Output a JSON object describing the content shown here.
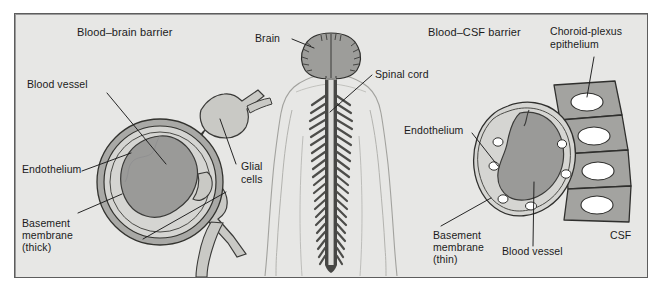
{
  "figure": {
    "panels": {
      "left_title": "Blood–brain barrier",
      "right_title": "Blood–CSF barrier"
    },
    "labels": {
      "blood_vessel_left": "Blood vessel",
      "endothelium_left": "Endothelium",
      "basement_membrane_left_l1": "Basement",
      "basement_membrane_left_l2": "membrane",
      "basement_membrane_left_l3": "(thick)",
      "glial_cells_l1": "Glial",
      "glial_cells_l2": "cells",
      "brain": "Brain",
      "spinal_cord": "Spinal cord",
      "choroid_plexus_l1": "Choroid-plexus",
      "choroid_plexus_l2": "epithelium",
      "endothelium_right": "Endothelium",
      "basement_membrane_right_l1": "Basement",
      "basement_membrane_right_l2": "membrane",
      "basement_membrane_right_l3": "(thin)",
      "blood_vessel_right": "Blood vessel",
      "csf": "CSF"
    },
    "colors": {
      "page_background": "#ffffff",
      "panel_background": "#e7e7e5",
      "panel_border": "#5d5d5d",
      "lumen_fill": "#9a9a98",
      "endothelium_fill": "#d5d5d2",
      "membrane_fill": "#a9a9a6",
      "glial_fill": "#c9c9c5",
      "epithelium_fill": "#a3a3a0",
      "nucleus_fill": "#ffffff",
      "brain_fill": "#9d9d9a",
      "body_outline": "#9c9c98",
      "cord_dark": "#4a4a48",
      "ink": "#1b1b1b"
    }
  }
}
